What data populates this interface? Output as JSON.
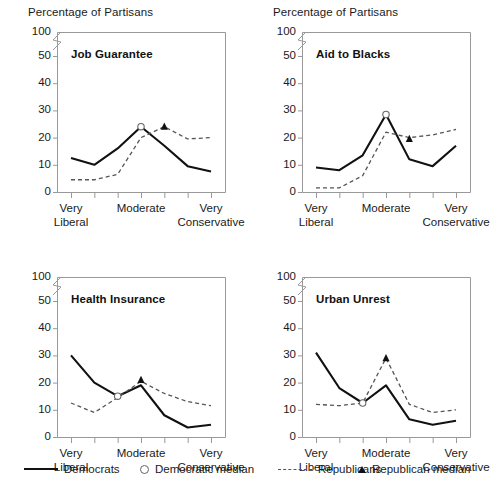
{
  "figure": {
    "axis_header": "Percentage of Partisans",
    "y_ticks": [
      0,
      10,
      20,
      30,
      40,
      50,
      100
    ],
    "y_axis_break": true,
    "x_tick_count": 7,
    "x_labels": [
      {
        "index": 0,
        "line1": "Very",
        "line2": "Liberal"
      },
      {
        "index": 3,
        "line1": "Moderate",
        "line2": ""
      },
      {
        "index": 6,
        "line1": "Very",
        "line2": "Conservative"
      }
    ],
    "colors": {
      "democrat_line": "#111111",
      "republican_line": "#555555",
      "axis": "#999999",
      "text": "#1a1a1a",
      "background": "#ffffff"
    }
  },
  "legend": {
    "items": [
      {
        "key": "democrats",
        "label": "Democrats",
        "marker": "solid-line"
      },
      {
        "key": "democratic-median",
        "label": "Democratic median",
        "marker": "open-circle"
      },
      {
        "key": "republicans",
        "label": "Republicans",
        "marker": "dashed-line"
      },
      {
        "key": "republican-median",
        "label": "Republican median",
        "marker": "filled-triangle"
      }
    ]
  },
  "chart_data": [
    {
      "type": "line",
      "title": "Job Guarantee",
      "panel": "top-left",
      "header": "Percentage of Partisans",
      "xlabel": "",
      "ylabel": "Percentage of Partisans",
      "ylim": [
        0,
        50
      ],
      "grid": false,
      "x": [
        1,
        2,
        3,
        4,
        5,
        6,
        7
      ],
      "categories": [
        "Very Liberal",
        "",
        "",
        "Moderate",
        "",
        "",
        "Very Conservative"
      ],
      "series": [
        {
          "name": "Democrats",
          "style": "solid",
          "values": [
            12.5,
            10.0,
            16.0,
            24.0,
            17.0,
            9.5,
            7.5
          ]
        },
        {
          "name": "Republicans",
          "style": "dashed",
          "values": [
            4.5,
            4.5,
            6.5,
            20.0,
            24.0,
            19.5,
            20.0
          ]
        }
      ],
      "annotations": [
        {
          "name": "Democratic median",
          "marker": "open-circle",
          "x": 4,
          "y": 24.0
        },
        {
          "name": "Republican median",
          "marker": "filled-triangle",
          "x": 5,
          "y": 24.0
        }
      ]
    },
    {
      "type": "line",
      "title": "Aid to Blacks",
      "panel": "top-right",
      "header": "Percentage of Partisans",
      "xlabel": "",
      "ylabel": "Percentage of Partisans",
      "ylim": [
        0,
        50
      ],
      "grid": false,
      "x": [
        1,
        2,
        3,
        4,
        5,
        6,
        7
      ],
      "categories": [
        "Very Liberal",
        "",
        "",
        "Moderate",
        "",
        "",
        "Very Conservative"
      ],
      "series": [
        {
          "name": "Democrats",
          "style": "solid",
          "values": [
            9.0,
            8.0,
            13.5,
            28.5,
            12.0,
            9.5,
            17.0
          ]
        },
        {
          "name": "Republicans",
          "style": "dashed",
          "values": [
            1.5,
            1.5,
            6.0,
            22.0,
            20.0,
            21.0,
            23.0
          ]
        }
      ],
      "annotations": [
        {
          "name": "Democratic median",
          "marker": "open-circle",
          "x": 4,
          "y": 28.5
        },
        {
          "name": "Republican median",
          "marker": "filled-triangle",
          "x": 5,
          "y": 19.5
        }
      ]
    },
    {
      "type": "line",
      "title": "Health Insurance",
      "panel": "bottom-left",
      "header": "",
      "xlabel": "",
      "ylabel": "",
      "ylim": [
        0,
        50
      ],
      "grid": false,
      "x": [
        1,
        2,
        3,
        4,
        5,
        6,
        7
      ],
      "categories": [
        "Very Liberal",
        "",
        "",
        "Moderate",
        "",
        "",
        "Very Conservative"
      ],
      "series": [
        {
          "name": "Democrats",
          "style": "solid",
          "values": [
            30.0,
            20.0,
            15.0,
            19.0,
            8.0,
            3.5,
            4.5
          ]
        },
        {
          "name": "Republicans",
          "style": "dashed",
          "values": [
            12.5,
            9.0,
            14.5,
            20.5,
            16.0,
            13.0,
            11.5
          ]
        }
      ],
      "annotations": [
        {
          "name": "Democratic median",
          "marker": "open-circle",
          "x": 3,
          "y": 15.0
        },
        {
          "name": "Republican median",
          "marker": "filled-triangle",
          "x": 4,
          "y": 21.0
        }
      ]
    },
    {
      "type": "line",
      "title": "Urban Unrest",
      "panel": "bottom-right",
      "header": "",
      "xlabel": "",
      "ylabel": "",
      "ylim": [
        0,
        50
      ],
      "grid": false,
      "x": [
        1,
        2,
        3,
        4,
        5,
        6,
        7
      ],
      "categories": [
        "Very Liberal",
        "",
        "",
        "Moderate",
        "",
        "",
        "Very Conservative"
      ],
      "series": [
        {
          "name": "Democrats",
          "style": "solid",
          "values": [
            31.0,
            18.0,
            12.5,
            19.0,
            6.5,
            4.5,
            6.0
          ]
        },
        {
          "name": "Republicans",
          "style": "dashed",
          "values": [
            12.0,
            11.5,
            12.5,
            29.0,
            12.0,
            9.0,
            10.0
          ]
        }
      ],
      "annotations": [
        {
          "name": "Democratic median",
          "marker": "open-circle",
          "x": 3,
          "y": 12.5
        },
        {
          "name": "Republican median",
          "marker": "filled-triangle",
          "x": 4,
          "y": 29.0
        }
      ]
    }
  ]
}
